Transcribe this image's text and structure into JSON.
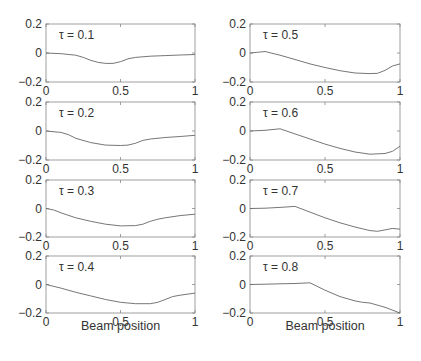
{
  "chart_data": {
    "type": "line",
    "layout": "4x2 grid of small multiples",
    "xlabel": "Beam position",
    "ylabel": "",
    "xlim": [
      0,
      1
    ],
    "ylim": [
      -0.2,
      0.2
    ],
    "xticks": [
      "0",
      "0.5",
      "1"
    ],
    "yticks": [
      "0.2",
      "0",
      "-0.2"
    ],
    "grid": false,
    "legend": null,
    "panels": [
      {
        "label": "τ = 0.1",
        "column": 0,
        "row": 0,
        "x": [
          0,
          0.1,
          0.2,
          0.25,
          0.3,
          0.35,
          0.4,
          0.45,
          0.5,
          0.55,
          0.6,
          0.7,
          0.8,
          0.9,
          1.0
        ],
        "y": [
          0,
          -0.005,
          -0.015,
          -0.03,
          -0.05,
          -0.065,
          -0.072,
          -0.072,
          -0.06,
          -0.04,
          -0.03,
          -0.022,
          -0.018,
          -0.014,
          -0.01
        ]
      },
      {
        "label": "τ = 0.2",
        "column": 0,
        "row": 1,
        "x": [
          0,
          0.1,
          0.15,
          0.2,
          0.3,
          0.4,
          0.5,
          0.55,
          0.6,
          0.65,
          0.7,
          0.8,
          0.9,
          1.0
        ],
        "y": [
          0,
          -0.01,
          -0.025,
          -0.05,
          -0.08,
          -0.097,
          -0.1,
          -0.097,
          -0.085,
          -0.065,
          -0.055,
          -0.045,
          -0.038,
          -0.03
        ]
      },
      {
        "label": "τ = 0.3",
        "column": 0,
        "row": 2,
        "x": [
          0,
          0.05,
          0.1,
          0.2,
          0.3,
          0.4,
          0.5,
          0.6,
          0.65,
          0.7,
          0.75,
          0.8,
          0.9,
          1.0
        ],
        "y": [
          0,
          -0.01,
          -0.03,
          -0.065,
          -0.09,
          -0.11,
          -0.122,
          -0.12,
          -0.11,
          -0.09,
          -0.075,
          -0.065,
          -0.05,
          -0.04
        ]
      },
      {
        "label": "τ = 0.4",
        "column": 0,
        "row": 3,
        "x": [
          0,
          0.1,
          0.2,
          0.3,
          0.4,
          0.5,
          0.6,
          0.7,
          0.75,
          0.8,
          0.85,
          0.9,
          1.0
        ],
        "y": [
          0,
          -0.025,
          -0.055,
          -0.08,
          -0.105,
          -0.125,
          -0.135,
          -0.135,
          -0.125,
          -0.105,
          -0.085,
          -0.075,
          -0.06
        ]
      },
      {
        "label": "τ = 0.5",
        "column": 1,
        "row": 0,
        "x": [
          0,
          0.05,
          0.1,
          0.2,
          0.3,
          0.4,
          0.5,
          0.6,
          0.7,
          0.8,
          0.85,
          0.9,
          0.95,
          1.0
        ],
        "y": [
          0,
          0.005,
          0.01,
          -0.015,
          -0.045,
          -0.075,
          -0.1,
          -0.122,
          -0.138,
          -0.142,
          -0.14,
          -0.12,
          -0.09,
          -0.075
        ]
      },
      {
        "label": "τ = 0.6",
        "column": 1,
        "row": 1,
        "x": [
          0,
          0.1,
          0.2,
          0.3,
          0.4,
          0.5,
          0.6,
          0.7,
          0.8,
          0.9,
          0.95,
          1.0
        ],
        "y": [
          0,
          0.005,
          0.015,
          -0.02,
          -0.055,
          -0.09,
          -0.12,
          -0.145,
          -0.16,
          -0.155,
          -0.14,
          -0.105
        ]
      },
      {
        "label": "τ = 0.7",
        "column": 1,
        "row": 2,
        "x": [
          0,
          0.1,
          0.2,
          0.3,
          0.4,
          0.5,
          0.6,
          0.7,
          0.8,
          0.85,
          0.9,
          0.95,
          1.0
        ],
        "y": [
          0,
          0.002,
          0.008,
          0.015,
          -0.025,
          -0.065,
          -0.1,
          -0.13,
          -0.155,
          -0.16,
          -0.15,
          -0.14,
          -0.145
        ]
      },
      {
        "label": "τ = 0.8",
        "column": 1,
        "row": 3,
        "x": [
          0,
          0.1,
          0.2,
          0.3,
          0.4,
          0.5,
          0.6,
          0.7,
          0.75,
          0.8,
          0.9,
          1.0
        ],
        "y": [
          0,
          0.002,
          0.005,
          0.007,
          0.012,
          -0.04,
          -0.085,
          -0.115,
          -0.125,
          -0.13,
          -0.16,
          -0.2
        ]
      }
    ]
  },
  "layout_px": {
    "columns_x": [
      [
        46,
        195
      ],
      [
        250,
        400
      ]
    ],
    "rows_y": [
      [
        24,
        82
      ],
      [
        102,
        160
      ],
      [
        180,
        237
      ],
      [
        256,
        313
      ]
    ]
  },
  "colors": {
    "line": "#666666",
    "frame": "#888888",
    "text": "#333333"
  }
}
